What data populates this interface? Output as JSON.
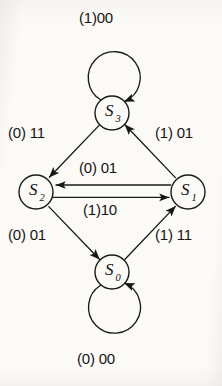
{
  "diagram": {
    "type": "state-transition-diagram",
    "title": "",
    "background_color": "#fbfaf7",
    "stroke_color": "#1a1a1a",
    "text_color": "#151515",
    "states": [
      {
        "id": "S3",
        "label": "S",
        "subscript": "3",
        "cx": 112,
        "cy": 113,
        "r": 17
      },
      {
        "id": "S2",
        "label": "S",
        "subscript": "2",
        "cx": 36,
        "cy": 192,
        "r": 17
      },
      {
        "id": "S1",
        "label": "S",
        "subscript": "1",
        "cx": 188,
        "cy": 192,
        "r": 17
      },
      {
        "id": "S0",
        "label": "S",
        "subscript": "0",
        "cx": 112,
        "cy": 272,
        "r": 17
      }
    ],
    "transitions": [
      {
        "from": "S3",
        "to": "S3",
        "label": "(1)00",
        "kind": "self-loop-top",
        "label_x": 79,
        "label_y": 10
      },
      {
        "from": "S3",
        "to": "S2",
        "label": "(0) 11",
        "kind": "diagonal",
        "label_x": 8,
        "label_y": 125
      },
      {
        "from": "S1",
        "to": "S3",
        "label": "(1) 01",
        "kind": "diagonal",
        "label_x": 155,
        "label_y": 125
      },
      {
        "from": "S1",
        "to": "S2",
        "label": "(0) 01",
        "kind": "horizontal-upper",
        "label_x": 79,
        "label_y": 160
      },
      {
        "from": "S2",
        "to": "S1",
        "label": "(1)10",
        "kind": "horizontal-lower",
        "label_x": 83,
        "label_y": 202
      },
      {
        "from": "S2",
        "to": "S0",
        "label": "(0) 01",
        "kind": "diagonal",
        "label_x": 8,
        "label_y": 227
      },
      {
        "from": "S0",
        "to": "S1",
        "label": "(1) 11",
        "kind": "diagonal",
        "label_x": 155,
        "label_y": 227
      },
      {
        "from": "S0",
        "to": "S0",
        "label": "(0) 00",
        "kind": "self-loop-bottom",
        "label_x": 77,
        "label_y": 351
      }
    ]
  }
}
